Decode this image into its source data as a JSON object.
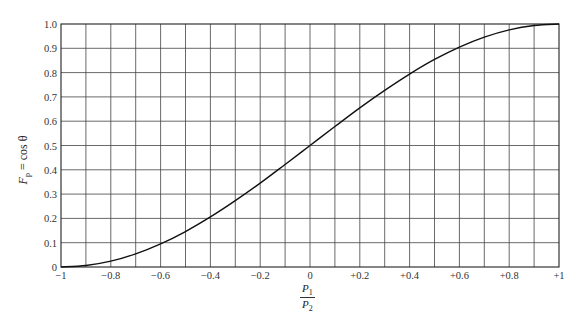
{
  "chart_data": {
    "type": "line",
    "title": "",
    "xlabel": "P1/P2",
    "xlabel_num": "P",
    "xlabel_num_sub": "1",
    "xlabel_den": "P",
    "xlabel_den_sub": "2",
    "ylabel": "F_p = cos θ",
    "ylabel_main": "F",
    "ylabel_sub": "p",
    "ylabel_rest": " = cos θ",
    "xlim": [
      -1,
      1
    ],
    "ylim": [
      0,
      1
    ],
    "grid": true,
    "x_grid_step": 0.1,
    "y_grid_step": 0.1,
    "x_ticks": [
      {
        "value": -1,
        "label": "−1"
      },
      {
        "value": -0.8,
        "label": "−0.8"
      },
      {
        "value": -0.6,
        "label": "−0.6"
      },
      {
        "value": -0.4,
        "label": "−0.4"
      },
      {
        "value": -0.2,
        "label": "−0.2"
      },
      {
        "value": 0,
        "label": "0"
      },
      {
        "value": 0.2,
        "label": "+0.2"
      },
      {
        "value": 0.4,
        "label": "+0.4"
      },
      {
        "value": 0.6,
        "label": "+0.6"
      },
      {
        "value": 0.8,
        "label": "+0.8"
      },
      {
        "value": 1,
        "label": "+1"
      }
    ],
    "y_ticks": [
      {
        "value": 0,
        "label": "0"
      },
      {
        "value": 0.1,
        "label": "0.1"
      },
      {
        "value": 0.2,
        "label": "0.2"
      },
      {
        "value": 0.3,
        "label": "0.3"
      },
      {
        "value": 0.4,
        "label": "0.4"
      },
      {
        "value": 0.5,
        "label": "0.5"
      },
      {
        "value": 0.6,
        "label": "0.6"
      },
      {
        "value": 0.7,
        "label": "0.7"
      },
      {
        "value": 0.8,
        "label": "0.8"
      },
      {
        "value": 0.9,
        "label": "0.9"
      },
      {
        "value": 1.0,
        "label": "1.0"
      }
    ],
    "series": [
      {
        "name": "F_p",
        "x": [
          -1.0,
          -0.9,
          -0.8,
          -0.7,
          -0.6,
          -0.5,
          -0.4,
          -0.3,
          -0.2,
          -0.1,
          0.0,
          0.1,
          0.2,
          0.3,
          0.4,
          0.5,
          0.6,
          0.7,
          0.8,
          0.9,
          1.0
        ],
        "values": [
          0.0,
          0.006,
          0.024,
          0.054,
          0.095,
          0.146,
          0.206,
          0.273,
          0.345,
          0.422,
          0.5,
          0.578,
          0.655,
          0.727,
          0.794,
          0.854,
          0.905,
          0.946,
          0.976,
          0.994,
          1.0
        ]
      }
    ],
    "plot_area": {
      "left": 61,
      "top": 24,
      "right": 559,
      "bottom": 267
    }
  }
}
